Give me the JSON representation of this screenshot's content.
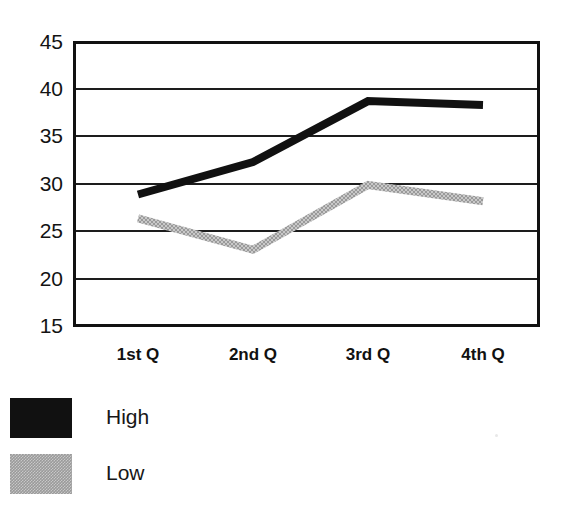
{
  "chart_data": {
    "type": "line",
    "title": "",
    "subtitle": "",
    "xlabel": "",
    "ylabel": "",
    "categories": [
      "1st Q",
      "2nd Q",
      "3rd Q",
      "4th Q"
    ],
    "series": [
      {
        "name": "High",
        "color": "#111111",
        "values": [
          28.9,
          32.3,
          38.7,
          38.3
        ]
      },
      {
        "name": "Low",
        "color": "#9a9a9a",
        "values": [
          26.4,
          23.1,
          29.9,
          28.2
        ]
      }
    ],
    "ylim": [
      15,
      45
    ],
    "yticks": [
      45,
      40,
      35,
      30,
      25,
      20,
      15
    ],
    "ytick_labels": [
      "45",
      "40",
      "35",
      "30",
      "25",
      "20",
      "15"
    ],
    "grid": true,
    "grid_axis": "y",
    "legend_position": "bottom-left",
    "legend_entries": [
      {
        "label": "High",
        "color": "#111111"
      },
      {
        "label": "Low",
        "color": "#9a9a9a"
      }
    ]
  },
  "colors": {
    "high_series": "#111111",
    "low_series": "#9a9a9a",
    "axis": "#111111",
    "grid": "#1d1d1d",
    "background": "#ffffff"
  }
}
